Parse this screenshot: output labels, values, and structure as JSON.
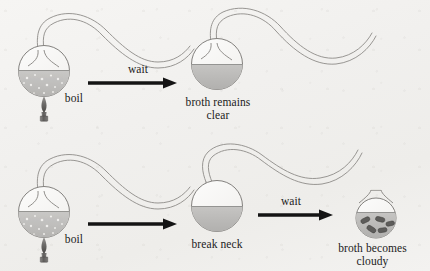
{
  "figure": {
    "background_color": "#f2f1ef",
    "ink_color": "#6f6e6c",
    "arrow_color": "#141414",
    "broth_color": "#b7b6b4",
    "bacteria_color": "#5d5c5a"
  },
  "rows": [
    {
      "id": "row-intact-neck",
      "steps": [
        {
          "id": "flask-boiling-1",
          "kind": "swan-neck-flask",
          "broth": "boiling",
          "burner": true,
          "label": "boil"
        },
        {
          "id": "arrow-wait-1",
          "kind": "arrow",
          "label": "wait"
        },
        {
          "id": "flask-clear",
          "kind": "swan-neck-flask",
          "broth": "clear",
          "burner": false,
          "label": "broth remains\nclear"
        }
      ]
    },
    {
      "id": "row-broken-neck",
      "steps": [
        {
          "id": "flask-boiling-2",
          "kind": "swan-neck-flask",
          "broth": "boiling",
          "burner": true,
          "label": "boil"
        },
        {
          "id": "arrow-break",
          "kind": "arrow",
          "label": ""
        },
        {
          "id": "flask-broken-neck",
          "kind": "broken-neck-flask",
          "broth": "clear",
          "burner": false,
          "label": "break neck"
        },
        {
          "id": "arrow-wait-2",
          "kind": "arrow",
          "label": "wait"
        },
        {
          "id": "flask-cloudy",
          "kind": "open-flask",
          "broth": "cloudy",
          "burner": false,
          "bacteria_count": 5,
          "label": "broth becomes\ncloudy"
        }
      ]
    }
  ],
  "labels": {
    "boil_1": "boil",
    "wait_1": "wait",
    "broth_remains_clear": "broth remains\nclear",
    "boil_2": "boil",
    "break_neck": "break neck",
    "wait_2": "wait",
    "broth_becomes_cloudy": "broth becomes\ncloudy"
  }
}
